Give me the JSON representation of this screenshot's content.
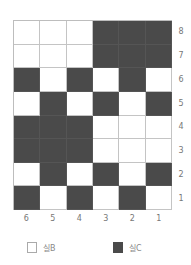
{
  "grid": {
    "rows": 8,
    "columns": 6,
    "row_labels": [
      "8",
      "7",
      "6",
      "5",
      "4",
      "3",
      "2",
      "1"
    ],
    "column_labels": [
      "6",
      "5",
      "4",
      "3",
      "2",
      "1"
    ],
    "cells": [
      [
        0,
        0,
        0,
        1,
        1,
        1
      ],
      [
        0,
        0,
        0,
        1,
        1,
        1
      ],
      [
        1,
        0,
        1,
        0,
        1,
        0
      ],
      [
        0,
        1,
        0,
        1,
        0,
        1
      ],
      [
        1,
        1,
        1,
        0,
        0,
        0
      ],
      [
        1,
        1,
        1,
        0,
        0,
        0
      ],
      [
        0,
        1,
        0,
        1,
        0,
        1
      ],
      [
        1,
        0,
        1,
        0,
        1,
        0
      ]
    ],
    "colors": {
      "light": "#ffffff",
      "dark": "#4a4a4a"
    }
  },
  "legend": {
    "items": [
      {
        "label": "실B",
        "swatch": "light"
      },
      {
        "label": "실C",
        "swatch": "dark"
      }
    ]
  }
}
